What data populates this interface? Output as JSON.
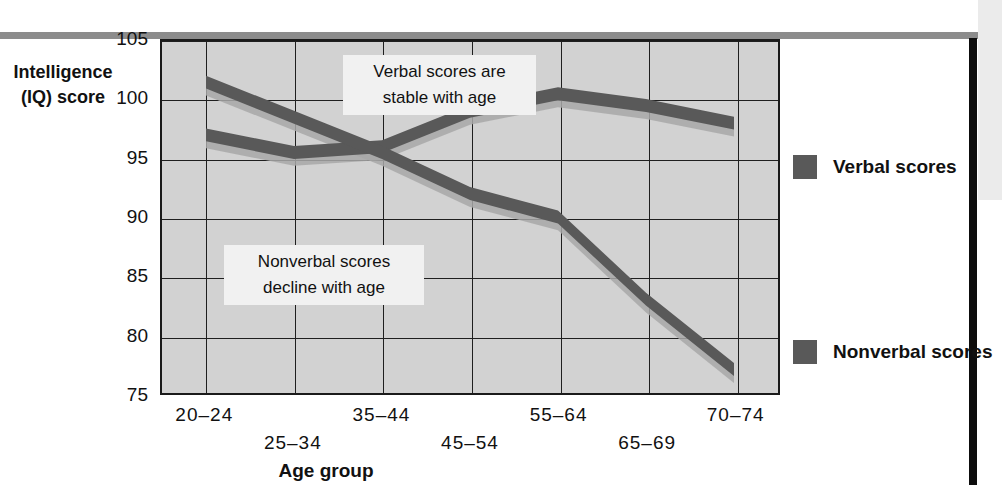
{
  "chart_data": {
    "type": "line",
    "title": "",
    "xlabel": "Age group",
    "ylabel": "Intelligence (IQ) score",
    "ylabel_line1": "Intelligence",
    "ylabel_line2": "(IQ) score",
    "categories": [
      "20-24",
      "25-34",
      "35-44",
      "45-54",
      "55-64",
      "65-69",
      "70-74"
    ],
    "ylim": [
      75,
      105
    ],
    "yticks": [
      105,
      100,
      95,
      90,
      85,
      80,
      75
    ],
    "grid": true,
    "legend_position": "right",
    "series": [
      {
        "name": "Verbal scores",
        "color": "#595959",
        "values": [
          97,
          95.5,
          96,
          99,
          100.5,
          99.5,
          98
        ]
      },
      {
        "name": "Nonverbal scores",
        "color": "#595959",
        "values": [
          101.5,
          98.5,
          95.5,
          92,
          90,
          83,
          77
        ]
      }
    ],
    "annotations": [
      {
        "id": "verbal",
        "line1": "Verbal scores are",
        "line2": "stable with age"
      },
      {
        "id": "nonverbal",
        "line1": "Nonverbal scores",
        "line2": "decline with age"
      }
    ]
  },
  "legend": {
    "items": [
      {
        "label": "Verbal scores",
        "color": "#595959"
      },
      {
        "label": "Nonverbal scores",
        "color": "#595959"
      }
    ]
  },
  "colors": {
    "band": "#595959",
    "band_shadow": "#a8a8a8",
    "plot_background": "#d2d2d2",
    "grid": "#1f1f1f",
    "top_rule": "#8c8c8c",
    "right_bar": "#0d0d0d"
  }
}
